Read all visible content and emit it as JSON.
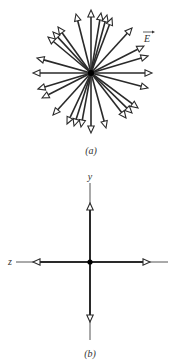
{
  "figure_a": {
    "caption": "(a)",
    "vector_label": "E",
    "description": "Radial electric field vectors pointing outward from a point charge",
    "arrow_count": 27
  },
  "figure_b": {
    "caption": "(b)",
    "axis_labels": {
      "vertical": "y",
      "horizontal": "z"
    },
    "description": "Cross-section showing field vectors along +y, -y, +z, -z from the charge"
  },
  "colors": {
    "stroke": "#2a2a2a",
    "background": "#ffffff",
    "arrowhead_fill": "#ffffff"
  }
}
